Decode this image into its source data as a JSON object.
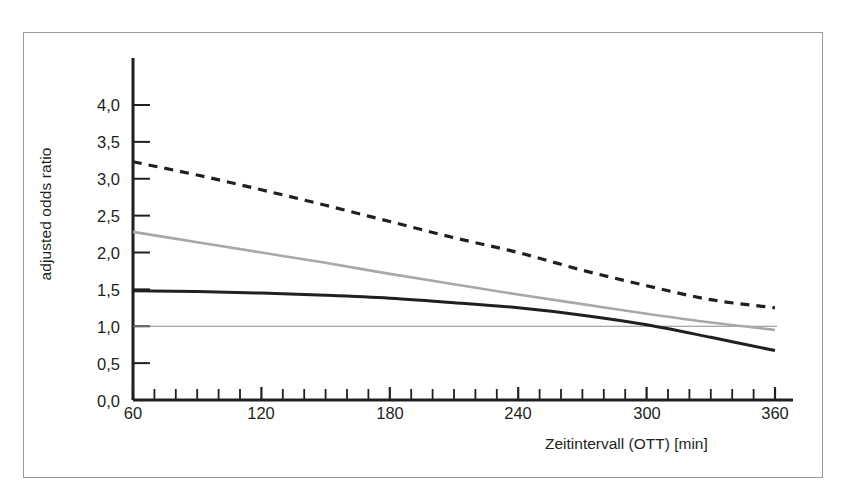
{
  "chart_data": {
    "type": "line",
    "title": "",
    "xlabel": "Zeitintervall (OTT) [min]",
    "ylabel": "adjusted odds ratio",
    "xlim": [
      60,
      360
    ],
    "ylim": [
      0.0,
      4.3
    ],
    "grid": false,
    "legend": "none",
    "x_ticks": [
      60,
      120,
      180,
      240,
      300,
      360
    ],
    "x_tick_labels": [
      "60",
      "120",
      "180",
      "240",
      "300",
      "360"
    ],
    "x_minor_tick_step": 10,
    "y_ticks": [
      0.0,
      0.5,
      1.0,
      1.5,
      2.0,
      2.5,
      3.0,
      3.5,
      4.0
    ],
    "y_tick_labels": [
      "0,0",
      "0,5",
      "1,0",
      "1,5",
      "2,0",
      "2,5",
      "3,0",
      "3,5",
      "4,0"
    ],
    "reference_line": {
      "name": "odds-ratio-1-reference",
      "y": 1.0,
      "color": "#8c8c8c",
      "style": "solid",
      "width": 1.2
    },
    "series": [
      {
        "name": "dashed-upper-curve",
        "style": "dashed",
        "color": "#231f20",
        "width": 3.2,
        "x": [
          60,
          90,
          120,
          150,
          180,
          210,
          240,
          270,
          300,
          330,
          360
        ],
        "values": [
          3.23,
          3.05,
          2.85,
          2.64,
          2.42,
          2.2,
          2.0,
          1.76,
          1.55,
          1.36,
          1.25
        ]
      },
      {
        "name": "gray-middle-curve",
        "style": "solid",
        "color": "#a8a8a8",
        "width": 2.6,
        "x": [
          60,
          90,
          120,
          150,
          180,
          210,
          240,
          270,
          300,
          330,
          360
        ],
        "values": [
          2.28,
          2.14,
          2.0,
          1.86,
          1.71,
          1.57,
          1.43,
          1.3,
          1.17,
          1.05,
          0.95
        ]
      },
      {
        "name": "black-lower-curve",
        "style": "solid",
        "color": "#231f20",
        "width": 3.0,
        "x": [
          60,
          90,
          120,
          150,
          180,
          210,
          240,
          270,
          300,
          330,
          360
        ],
        "values": [
          1.48,
          1.47,
          1.45,
          1.42,
          1.38,
          1.32,
          1.25,
          1.15,
          1.02,
          0.85,
          0.67
        ]
      }
    ]
  },
  "axis": {
    "y_axis_label": "adjusted odds ratio",
    "x_axis_label": "Zeitintervall (OTT) [min]"
  },
  "colors": {
    "frame": "#9a9a9a",
    "axis": "#231f20",
    "text": "#231f20",
    "gray_series": "#a8a8a8",
    "reference": "#8c8c8c",
    "background": "#ffffff"
  }
}
